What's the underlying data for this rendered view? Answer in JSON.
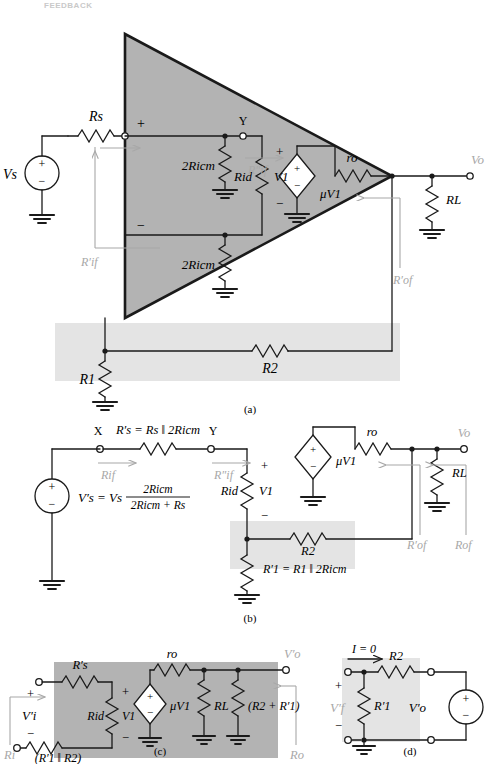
{
  "page": {
    "running_head": "FEEDBACK",
    "page_number": "",
    "figure_parts": [
      "(a)",
      "(b)",
      "(c)",
      "(d)"
    ]
  },
  "colors": {
    "shade_dark": "#b3b3b3",
    "shade_light": "#e4e4e4",
    "gray_label": "#a8a8a8",
    "line": "#1a1a1a",
    "background": "#ffffff"
  },
  "fig_a": {
    "caption": "(a)",
    "source_label": "Vs",
    "rs_label": "Rs",
    "node_y": "Y",
    "r2icm_top": "2Ricm",
    "r2icm_bottom": "2Ricm",
    "rid": "Rid",
    "v1": "V1",
    "plus_top": "+",
    "minus_bot": "−",
    "v1_plus": "+",
    "v1_minus": "−",
    "ro": "ro",
    "dep_src": "μV1",
    "vo": "Vo",
    "rl": "RL",
    "r_if_prime": "R′if",
    "r_if_dprime": "R″if",
    "r_of_prime": "R′of",
    "r1": "R1",
    "r2": "R2"
  },
  "fig_b": {
    "caption": "(b)",
    "node_x": "X",
    "node_y": "Y",
    "rs_prime_eq": "R′s = Rs ‖ 2Ricm",
    "vs_prime_eq_lhs": "V′s = Vs",
    "vs_prime_num": "2Ricm",
    "vs_prime_den": "2Ricm + Rs",
    "rid": "Rid",
    "v1": "V1",
    "v1_plus": "+",
    "v1_minus": "−",
    "ro": "ro",
    "dep_src": "μV1",
    "vo": "Vo",
    "rl": "RL",
    "r2": "R2",
    "r1_prime_eq": "R′1 = R1 ‖ 2Ricm",
    "r_if": "Rif",
    "r_if_dprime": "R″if",
    "r_of_prime": "R′of",
    "r_of": "Rof"
  },
  "fig_c": {
    "caption": "(c)",
    "rs_prime": "R′s",
    "rid": "Rid",
    "v1": "V1",
    "v1_plus": "+",
    "v1_minus": "−",
    "vi_prime": "V′i",
    "vi_plus": "+",
    "vi_minus": "−",
    "r1_par_r2": "(R′1 ‖ R2)",
    "ro": "ro",
    "dep_src": "μV1",
    "rl": "RL",
    "r2_plus_r1": "(R2 + R′1)",
    "vo_prime": "V′o",
    "ri": "Ri",
    "ro_label": "Ro"
  },
  "fig_d": {
    "caption": "(d)",
    "current": "I = 0",
    "r2": "R2",
    "r1_prime": "R′1",
    "vf_prime": "V′f",
    "vf_plus": "+",
    "vf_minus": "−",
    "vo_prime": "V′o"
  }
}
